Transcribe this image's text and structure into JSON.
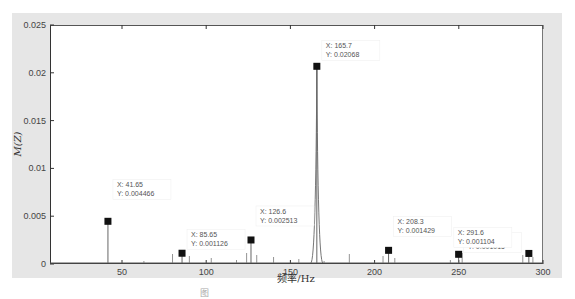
{
  "chart_data": {
    "type": "line",
    "title": "",
    "xlabel": "频率/Hz",
    "ylabel": "M(Z)",
    "xlim": [
      8,
      300
    ],
    "ylim": [
      0,
      0.025
    ],
    "grid": false,
    "xticks": [
      50,
      100,
      150,
      200,
      250,
      300
    ],
    "xtick_labels": [
      "50",
      "100",
      "150",
      "200",
      "250",
      "300"
    ],
    "yticks": [
      0,
      0.005,
      0.01,
      0.015,
      0.02,
      0.025
    ],
    "ytick_labels": [
      "0",
      "0.005",
      "0.01",
      "0.015",
      "0.02",
      "0.025"
    ],
    "series": [
      {
        "name": "spectrum",
        "peaks": [
          {
            "x": 41.65,
            "y": 0.004466
          },
          {
            "x": 85.65,
            "y": 0.001126
          },
          {
            "x": 126.6,
            "y": 0.002513
          },
          {
            "x": 165.7,
            "y": 0.02068
          },
          {
            "x": 208.3,
            "y": 0.001429
          },
          {
            "x": 249.9,
            "y": 0.001015
          },
          {
            "x": 291.6,
            "y": 0.001104
          }
        ]
      }
    ],
    "datatips": [
      {
        "x_label": "X: 41.65",
        "y_label": "Y: 0.004466"
      },
      {
        "x_label": "X: 85.65",
        "y_label": "Y: 0.001126"
      },
      {
        "x_label": "X: 126.6",
        "y_label": "Y: 0.002513"
      },
      {
        "x_label": "X: 165.7",
        "y_label": "Y: 0.02068"
      },
      {
        "x_label": "X: 208.3",
        "y_label": "Y: 0.001429"
      },
      {
        "x_label": "X: 249.9",
        "y_label": "Y: 0.001015"
      },
      {
        "x_label": "X: 291.6",
        "y_label": "Y: 0.001104"
      }
    ]
  },
  "caption": "图"
}
